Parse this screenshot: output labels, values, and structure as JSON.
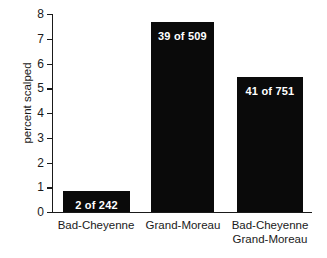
{
  "chart_data": {
    "type": "bar",
    "title": "",
    "xlabel": "",
    "ylabel": "percent scalped",
    "ylim": [
      0,
      8
    ],
    "yticks": [
      0,
      1,
      2,
      3,
      4,
      5,
      6,
      7,
      8
    ],
    "ytick_labels": [
      "0",
      "1",
      "2",
      "3",
      "4",
      "5",
      "6",
      "7",
      "8"
    ],
    "grid": false,
    "legend": null,
    "bar_color": "#0a0a0a",
    "label_color": "#ffffff",
    "background": "#ffffff",
    "categories": [
      "Bad-Cheyenne",
      "Grand-Moreau",
      "Bad-Cheyenne Grand-Moreau"
    ],
    "values": [
      0.83,
      7.66,
      5.46
    ],
    "annotations": [
      "2 of 242",
      "39 of 509",
      "41 of 751"
    ],
    "counts": [
      {
        "scalped": 2,
        "total": 242
      },
      {
        "scalped": 39,
        "total": 509
      },
      {
        "scalped": 41,
        "total": 751
      }
    ]
  },
  "axis": {
    "ylabel": "percent scalped",
    "ticks": [
      {
        "label": "8",
        "value": 8
      },
      {
        "label": "7",
        "value": 7
      },
      {
        "label": "6",
        "value": 6
      },
      {
        "label": "5",
        "value": 5
      },
      {
        "label": "4",
        "value": 4
      },
      {
        "label": "3",
        "value": 3
      },
      {
        "label": "2",
        "value": 2
      },
      {
        "label": "1",
        "value": 1
      },
      {
        "label": "0",
        "value": 0
      }
    ]
  },
  "bars": [
    {
      "category_line1": "Bad-Cheyenne",
      "category_line2": "",
      "annotation": "2 of 242",
      "value": 0.83
    },
    {
      "category_line1": "Grand-Moreau",
      "category_line2": "",
      "annotation": "39 of 509",
      "value": 7.66
    },
    {
      "category_line1": "Bad-Cheyenne",
      "category_line2": "Grand-Moreau",
      "annotation": "41 of 751",
      "value": 5.46
    }
  ]
}
